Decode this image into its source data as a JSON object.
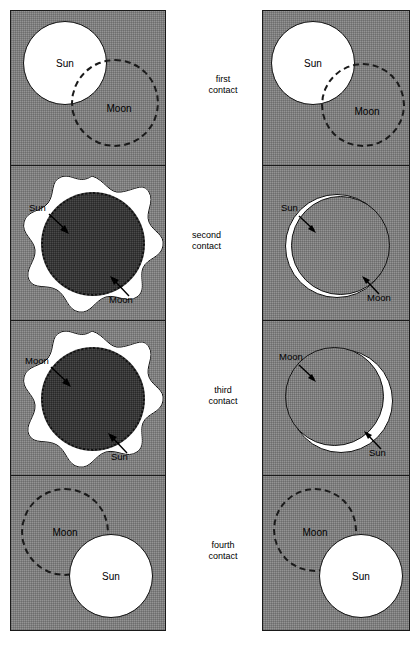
{
  "figure": {
    "background_color": "#ffffff",
    "sky_color": "#949494",
    "sun_color": "#ffffff",
    "moon_dark_color": "#4a4a4a",
    "outline_color": "#1a1a1a"
  },
  "stages": [
    {
      "id": "first",
      "line1": "first",
      "line2": "contact"
    },
    {
      "id": "second",
      "line1": "second",
      "line2": "contact"
    },
    {
      "id": "third",
      "line1": "third",
      "line2": "contact"
    },
    {
      "id": "fourth",
      "line1": "fourth",
      "line2": "contact"
    }
  ],
  "columns": {
    "left": {
      "name": "total-eclipse-sequence",
      "panels": [
        {
          "stage": "first",
          "type": "partial",
          "sun_label": "Sun",
          "moon_label": "Moon"
        },
        {
          "stage": "second",
          "type": "totality",
          "sun_label": "Sun",
          "moon_label": "Moon"
        },
        {
          "stage": "third",
          "type": "totality",
          "moon_label": "Moon",
          "sun_label": "Sun"
        },
        {
          "stage": "fourth",
          "type": "partial",
          "moon_label": "Moon",
          "sun_label": "Sun"
        }
      ]
    },
    "right": {
      "name": "annular-eclipse-sequence",
      "panels": [
        {
          "stage": "first",
          "type": "partial",
          "sun_label": "Sun",
          "moon_label": "Moon"
        },
        {
          "stage": "second",
          "type": "annular",
          "sun_label": "Sun",
          "moon_label": "Moon"
        },
        {
          "stage": "third",
          "type": "annular",
          "moon_label": "Moon",
          "sun_label": "Sun"
        },
        {
          "stage": "fourth",
          "type": "partial",
          "moon_label": "Moon",
          "sun_label": "Sun"
        }
      ]
    }
  }
}
